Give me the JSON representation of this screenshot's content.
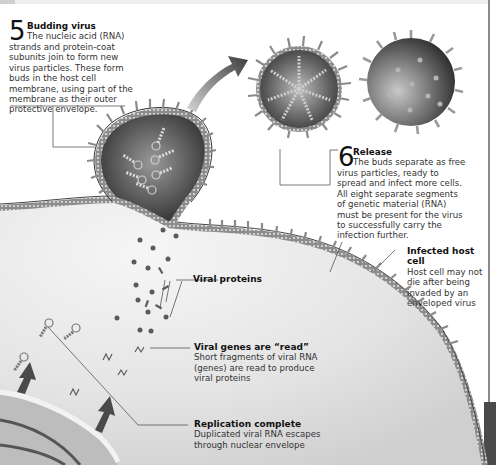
{
  "steps": [
    {
      "number": "5",
      "title": "Budding virus",
      "text_first": "The nucleic acid (RNA)",
      "text_rest": "strands and protein-coat subunits join to form new virus particles. These form buds in the host cell membrane, using part of the membrane as their outer protective envelope."
    },
    {
      "number": "6",
      "title": "Release",
      "text_first": "The buds separate as free",
      "text_rest": "virus particles, ready to spread and infect more cells. All eight separate segments of genetic material (RNA) must be present for the virus to successfully carry the infection further."
    }
  ],
  "callouts": [
    {
      "title": "Infected host cell",
      "text": "Host cell may not die after being invaded by an enveloped virus"
    },
    {
      "title": "Viral proteins",
      "text": ""
    },
    {
      "title": "Viral genes are “read”",
      "text": "Short fragments of viral RNA (genes) are read to produce viral proteins"
    },
    {
      "title": "Replication complete",
      "text": "Duplicated viral RNA escapes through nuclear envelope"
    }
  ],
  "colors": {
    "membrane": "#6e6e6e",
    "cytoplasm": "#e6e6e6",
    "arrow": "#4a4a4a",
    "text": "#2a2a2a",
    "leader": "#555555"
  }
}
